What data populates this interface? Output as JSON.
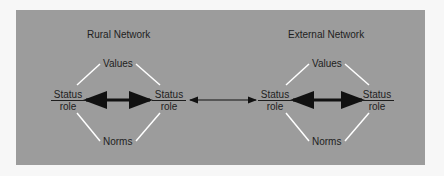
{
  "networks": [
    {
      "title": "Rural Network",
      "values_label": "Values",
      "norms_label": "Norms",
      "left_node": {
        "top": "Status",
        "bottom": "role"
      },
      "right_node": {
        "top": "Status",
        "bottom": "role"
      }
    },
    {
      "title": "External Network",
      "values_label": "Values",
      "norms_label": "Norms",
      "left_node": {
        "top": "Status",
        "bottom": "role"
      },
      "right_node": {
        "top": "Status",
        "bottom": "role"
      }
    }
  ],
  "colors": {
    "panel": "#9c9c9c",
    "lines": "#ffffff",
    "arrows": "#111111",
    "text": "#1e1e1e"
  }
}
